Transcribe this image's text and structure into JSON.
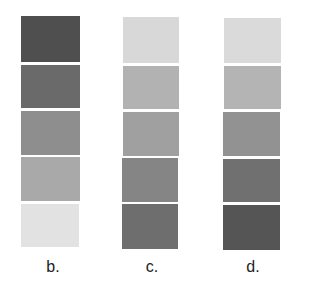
{
  "columns": [
    {
      "label": "b.",
      "swatches": [
        "#4f4f4f",
        "#6a6a6a",
        "#8e8e8e",
        "#a9a9a9",
        "#e2e2e2"
      ]
    },
    {
      "label": "c.",
      "swatches": [
        "#d8d8d8",
        "#b2b2b2",
        "#a0a0a0",
        "#858585",
        "#6e6e6e"
      ]
    },
    {
      "label": "d.",
      "swatches": [
        "#dadada",
        "#b4b4b4",
        "#929292",
        "#707070",
        "#555555"
      ]
    }
  ]
}
